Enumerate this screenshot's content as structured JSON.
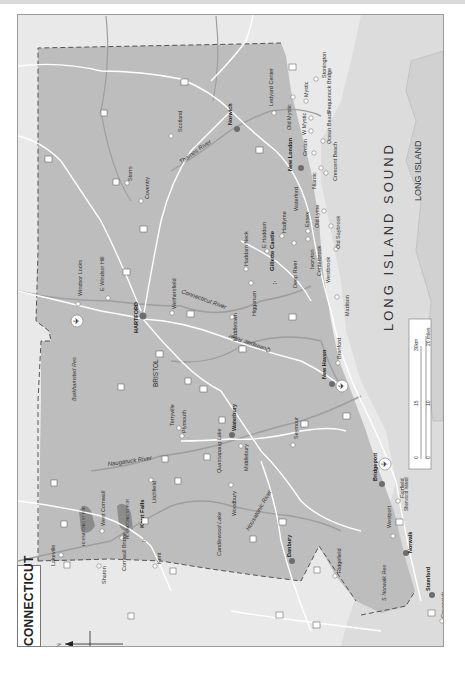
{
  "map": {
    "title": "CONNECTICUT",
    "orientation": "rotated 90° counter-clockwise (north points left)",
    "north_arrow": "N",
    "colors": {
      "land_state": "#bdbdbd",
      "land_outside": "#e9e9e9",
      "water_sound": "#dcdcdc",
      "roads": "#ffffff",
      "rivers": "#9e9e9e",
      "border_dash": "#555555",
      "city_major": "#6d6d6d",
      "town_marker": "#ffffff",
      "forest": "#8c8c8c"
    },
    "water_bodies": {
      "sound": "LONG ISLAND SOUND",
      "island": "LONG ISLAND"
    },
    "rivers": [
      "Thames River",
      "Connecticut River",
      "Quinnipiac River",
      "Naugatuck River",
      "Housatonic River"
    ],
    "major_cities": [
      "HARTFORD",
      "Norwich",
      "New London",
      "New Haven",
      "Waterbury",
      "Bridgeport",
      "Norwalk",
      "Stamford",
      "Danbury"
    ],
    "attractions": [
      "Gillette Castle",
      "Kent Falls"
    ],
    "caps_labels": [
      "BRISTOL"
    ],
    "towns": [
      "Scotland",
      "Storrs",
      "Coventry",
      "Ledyard Center",
      "Old Mystic",
      "Mystic",
      "W Mystic",
      "Stonington",
      "Pequonock Bridge",
      "Ocean Beach",
      "Groton",
      "Crescent Beach",
      "Niantic",
      "Waterford",
      "Old Lyme",
      "Old Saybrook",
      "Essex",
      "Ivoryton",
      "Centerbrook",
      "Westbrook",
      "Hadlyme",
      "E Haddam",
      "Haddam Neck",
      "Deep River",
      "Higganum",
      "Middletown",
      "Madison",
      "Branford",
      "Windsor Locks",
      "E Windsor Hill",
      "Wethersfield",
      "Terryville",
      "Plymouth",
      "Middlebury",
      "Seymour",
      "Woodbury",
      "Litchfield",
      "West Cornwall",
      "Sharon",
      "Lakeville",
      "Cornwall Bridge",
      "Kent",
      "Ridgefield",
      "Westport",
      "Fairfield",
      "Sherwood Island",
      "Greenwich"
    ],
    "lakes": [
      "Barkhamsted Res",
      "Quassapaug Lake",
      "Candlewood Lake",
      "S Norwalk Res"
    ],
    "forests": [
      "HOUSATONIC ST FOR",
      "HOUSATONIC ST FOR"
    ],
    "airports": 3,
    "scale_bar": {
      "km_labels": [
        "0",
        "15",
        "30km"
      ],
      "mile_labels": [
        "0",
        "10",
        "20 miles"
      ]
    }
  }
}
